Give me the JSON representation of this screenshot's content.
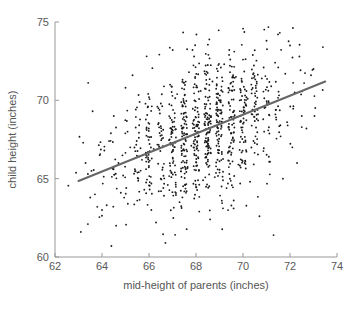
{
  "chart_data": {
    "type": "scatter",
    "title": "",
    "xlabel": "mid-height of parents (inches)",
    "ylabel": "child height (inches)",
    "xlim": [
      62,
      74
    ],
    "ylim": [
      60,
      75
    ],
    "xticks": [
      62,
      64,
      66,
      68,
      70,
      72,
      74
    ],
    "yticks": [
      60,
      65,
      70,
      75
    ],
    "xtick_labels": [
      "62",
      "64",
      "66",
      "68",
      "70",
      "72",
      "74"
    ],
    "ytick_labels": [
      "60",
      "65",
      "70",
      "75"
    ],
    "grid": false,
    "legend": null,
    "point_color": "#1a1a1a",
    "point_size": 1.5,
    "n_points": 898,
    "series": [
      {
        "name": "galton-parent-child-heights",
        "marker": "dot",
        "x_mean": 68.31,
        "y_mean": 68.09,
        "x_sd": 1.79,
        "y_sd": 2.52,
        "correlation": 0.46
      }
    ],
    "fit_line": {
      "name": "regression-line",
      "color": "#666666",
      "width": 2,
      "slope": 0.605,
      "intercept": 26.73,
      "x_start": 63.0,
      "y_start": 64.85,
      "x_end": 73.5,
      "y_end": 71.2
    },
    "axis_color": "#999999",
    "background": "#ffffff",
    "points": [
      [
        63.2,
        67.3
      ],
      [
        63.3,
        66.0
      ],
      [
        63.1,
        61.6
      ],
      [
        63.4,
        65.3
      ],
      [
        63.5,
        63.8
      ],
      [
        63.6,
        69.3
      ],
      [
        63.7,
        64.0
      ],
      [
        63.8,
        63.2
      ],
      [
        63.9,
        66.5
      ],
      [
        63.4,
        62.1
      ],
      [
        64.0,
        63.0
      ],
      [
        64.1,
        66.8
      ],
      [
        64.2,
        63.3
      ],
      [
        64.3,
        67.4
      ],
      [
        64.4,
        60.7
      ],
      [
        64.5,
        69.0
      ],
      [
        64.6,
        62.0
      ],
      [
        64.7,
        66.0
      ],
      [
        64.8,
        64.1
      ],
      [
        64.9,
        65.2
      ],
      [
        65.0,
        70.8
      ],
      [
        65.1,
        63.4
      ],
      [
        65.2,
        67.0
      ],
      [
        65.3,
        71.6
      ],
      [
        65.4,
        65.6
      ],
      [
        65.5,
        63.6
      ],
      [
        65.6,
        69.9
      ],
      [
        65.7,
        66.2
      ],
      [
        65.8,
        64.3
      ],
      [
        65.9,
        68.1
      ],
      [
        66.0,
        70.2
      ],
      [
        66.1,
        63.0
      ],
      [
        66.2,
        66.9
      ],
      [
        66.3,
        62.2
      ],
      [
        66.4,
        69.5
      ],
      [
        66.5,
        65.0
      ],
      [
        66.6,
        67.6
      ],
      [
        66.7,
        60.9
      ],
      [
        66.8,
        64.6
      ],
      [
        66.9,
        71.0
      ],
      [
        67.0,
        68.6
      ],
      [
        67.1,
        65.4
      ],
      [
        67.2,
        70.4
      ],
      [
        67.3,
        63.5
      ],
      [
        67.4,
        66.6
      ],
      [
        67.5,
        69.2
      ],
      [
        67.6,
        64.2
      ],
      [
        67.7,
        71.8
      ],
      [
        67.8,
        67.1
      ],
      [
        67.9,
        65.8
      ],
      [
        68.0,
        68.9
      ],
      [
        68.1,
        66.3
      ],
      [
        68.2,
        70.6
      ],
      [
        68.3,
        64.9
      ],
      [
        68.4,
        69.6
      ],
      [
        68.5,
        67.4
      ],
      [
        68.6,
        62.4
      ],
      [
        68.7,
        71.2
      ],
      [
        68.8,
        65.1
      ],
      [
        68.9,
        68.3
      ],
      [
        69.0,
        70.0
      ],
      [
        69.1,
        66.7
      ],
      [
        69.2,
        72.3
      ],
      [
        69.3,
        64.4
      ],
      [
        69.4,
        69.8
      ],
      [
        69.5,
        67.9
      ],
      [
        69.6,
        63.1
      ],
      [
        69.7,
        71.5
      ],
      [
        69.8,
        65.9
      ],
      [
        69.9,
        68.7
      ],
      [
        70.0,
        72.6
      ],
      [
        70.1,
        66.1
      ],
      [
        70.2,
        70.1
      ],
      [
        70.3,
        64.8
      ],
      [
        70.4,
        69.1
      ],
      [
        70.5,
        73.2
      ],
      [
        70.6,
        67.2
      ],
      [
        70.7,
        62.6
      ],
      [
        70.8,
        71.4
      ],
      [
        70.9,
        68.0
      ],
      [
        71.0,
        73.8
      ],
      [
        71.1,
        66.4
      ],
      [
        71.2,
        70.9
      ],
      [
        71.3,
        61.4
      ],
      [
        71.4,
        69.4
      ],
      [
        71.5,
        72.1
      ],
      [
        71.6,
        67.7
      ],
      [
        71.7,
        65.0
      ],
      [
        71.8,
        71.7
      ],
      [
        71.9,
        68.4
      ],
      [
        72.0,
        73.5
      ],
      [
        72.1,
        67.0
      ],
      [
        72.2,
        70.5
      ],
      [
        72.3,
        66.0
      ],
      [
        72.4,
        72.8
      ],
      [
        72.5,
        69.0
      ],
      [
        72.6,
        71.1
      ],
      [
        72.7,
        68.2
      ],
      [
        73.0,
        72.0
      ],
      [
        73.4,
        73.4
      ]
    ]
  },
  "figure": {
    "xlabel": "mid-height of parents (inches)",
    "ylabel": "child height (inches)"
  }
}
